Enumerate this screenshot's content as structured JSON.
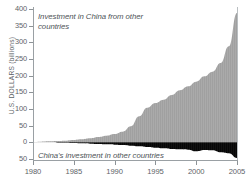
{
  "chart_data": {
    "type": "area",
    "title": "",
    "subtitle": "",
    "xlabel": "",
    "ylabel": "U.S. DOLLARS (billions)",
    "xlim": [
      1980,
      2005
    ],
    "ylim": [
      -50,
      400
    ],
    "grid": false,
    "legend_position": "inline-annotations",
    "y_ticks": [
      400,
      350,
      300,
      250,
      200,
      150,
      100,
      50,
      0,
      -50
    ],
    "y_tick_labels": [
      "400",
      "350",
      "300",
      "250",
      "200",
      "150",
      "100",
      "50",
      "0",
      "50"
    ],
    "x_ticks": [
      1980,
      1985,
      1990,
      1995,
      2000,
      2005
    ],
    "x_tick_labels": [
      "1980",
      "1985",
      "1990",
      "1995",
      "2000",
      "2005"
    ],
    "annotations": [
      {
        "name": "inbound-investment-label",
        "text": "Investment in China from other countries",
        "series": "inbound",
        "color": "#a9a9a9"
      },
      {
        "name": "outbound-investment-label",
        "text": "China's investment in other countries",
        "series": "outbound",
        "color": "#111111"
      }
    ],
    "x": [
      1980,
      1981,
      1982,
      1983,
      1984,
      1985,
      1986,
      1987,
      1988,
      1989,
      1990,
      1991,
      1992,
      1993,
      1994,
      1995,
      1996,
      1997,
      1998,
      1999,
      2000,
      2001,
      2002,
      2003,
      2004,
      2005
    ],
    "series": [
      {
        "name": "Investment in China from other countries",
        "key": "inbound",
        "color": "#a9a9a9",
        "values": [
          1,
          2,
          3,
          4,
          5,
          7,
          9,
          12,
          16,
          20,
          25,
          32,
          48,
          78,
          104,
          118,
          128,
          142,
          156,
          168,
          182,
          198,
          212,
          238,
          288,
          388
        ]
      },
      {
        "name": "China's investment in other countries",
        "key": "outbound",
        "color": "#111111",
        "values": [
          0,
          0,
          0,
          -1,
          -1,
          -2,
          -3,
          -4,
          -5,
          -6,
          -7,
          -8,
          -10,
          -12,
          -14,
          -16,
          -18,
          -20,
          -21,
          -22,
          -27,
          -23,
          -24,
          -30,
          -33,
          -47
        ]
      }
    ]
  },
  "axes": {
    "y_title": "U.S. DOLLARS (billions)"
  }
}
